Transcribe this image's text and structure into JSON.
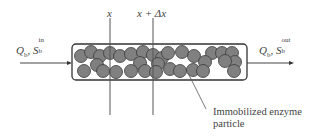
{
  "diagram": {
    "type": "packed-bed enzyme reactor schematic",
    "inlet": {
      "flow_symbol": "Q",
      "flow_sub": "b",
      "conc_symbol": "S",
      "conc_sub": "b",
      "conc_sup": "in",
      "separator": ","
    },
    "outlet": {
      "flow_symbol": "Q",
      "flow_sub": "b",
      "conc_symbol": "S",
      "conc_sub": "b",
      "conc_sup": "out",
      "separator": ","
    },
    "position_labels": {
      "x": "x",
      "x_plus_dx": "x + Δx"
    },
    "particle_label": {
      "line1": "Immobilized enzyme",
      "line2": "particle"
    },
    "colors": {
      "particle_fill": "#808080",
      "particle_stroke": "#3a3a3a",
      "line": "#444444",
      "background": "#ffffff"
    }
  }
}
